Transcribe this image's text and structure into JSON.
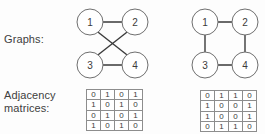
{
  "figure": {
    "background_color": "#fdfdfd",
    "stroke_color": "#3a3a3a",
    "node_stroke_color": "#6f6f6f",
    "matrix_border_color": "#8d8d8d",
    "text_color": "#3b3b3b"
  },
  "labels": {
    "graphs": "Graphs:",
    "adjacency_line1": "Adjacency",
    "adjacency_line2": "matrices:"
  },
  "graphs": [
    {
      "id": "left",
      "name": "crossed-graph",
      "nodes": [
        {
          "label": "1",
          "cx": 20,
          "cy": 22,
          "r": 13
        },
        {
          "label": "2",
          "cx": 65,
          "cy": 22,
          "r": 13
        },
        {
          "label": "3",
          "cx": 20,
          "cy": 65,
          "r": 13
        },
        {
          "label": "4",
          "cx": 65,
          "cy": 65,
          "r": 13
        }
      ],
      "edges": [
        {
          "from": "1",
          "to": "2",
          "x1": 33,
          "y1": 22,
          "x2": 52,
          "y2": 22
        },
        {
          "from": "3",
          "to": "4",
          "x1": 33,
          "y1": 65,
          "x2": 52,
          "y2": 65
        },
        {
          "from": "1",
          "to": "4",
          "x1": 28.5,
          "y1": 32.5,
          "x2": 56.5,
          "y2": 54.5
        },
        {
          "from": "2",
          "to": "3",
          "x1": 56.5,
          "y1": 32.5,
          "x2": 28.5,
          "y2": 54.5
        }
      ]
    },
    {
      "id": "right",
      "name": "square-graph",
      "nodes": [
        {
          "label": "1",
          "cx": 19,
          "cy": 22,
          "r": 13
        },
        {
          "label": "2",
          "cx": 59,
          "cy": 22,
          "r": 13
        },
        {
          "label": "3",
          "cx": 19,
          "cy": 65,
          "r": 13
        },
        {
          "label": "4",
          "cx": 59,
          "cy": 65,
          "r": 13
        }
      ],
      "edges": [
        {
          "from": "1",
          "to": "2",
          "x1": 32,
          "y1": 22,
          "x2": 46,
          "y2": 22
        },
        {
          "from": "1",
          "to": "3",
          "x1": 19,
          "y1": 35,
          "x2": 19,
          "y2": 52
        },
        {
          "from": "2",
          "to": "4",
          "x1": 59,
          "y1": 35,
          "x2": 59,
          "y2": 52
        },
        {
          "from": "3",
          "to": "4",
          "x1": 32,
          "y1": 65,
          "x2": 46,
          "y2": 65
        }
      ]
    }
  ],
  "matrices": [
    {
      "id": "left",
      "name": "adjacency-matrix-left",
      "rows": [
        [
          "0",
          "1",
          "0",
          "1"
        ],
        [
          "1",
          "0",
          "1",
          "0"
        ],
        [
          "0",
          "1",
          "0",
          "1"
        ],
        [
          "1",
          "0",
          "1",
          "0"
        ]
      ]
    },
    {
      "id": "right",
      "name": "adjacency-matrix-right",
      "rows": [
        [
          "0",
          "1",
          "1",
          "0"
        ],
        [
          "1",
          "0",
          "0",
          "1"
        ],
        [
          "1",
          "0",
          "0",
          "1"
        ],
        [
          "0",
          "1",
          "1",
          "0"
        ]
      ]
    }
  ]
}
